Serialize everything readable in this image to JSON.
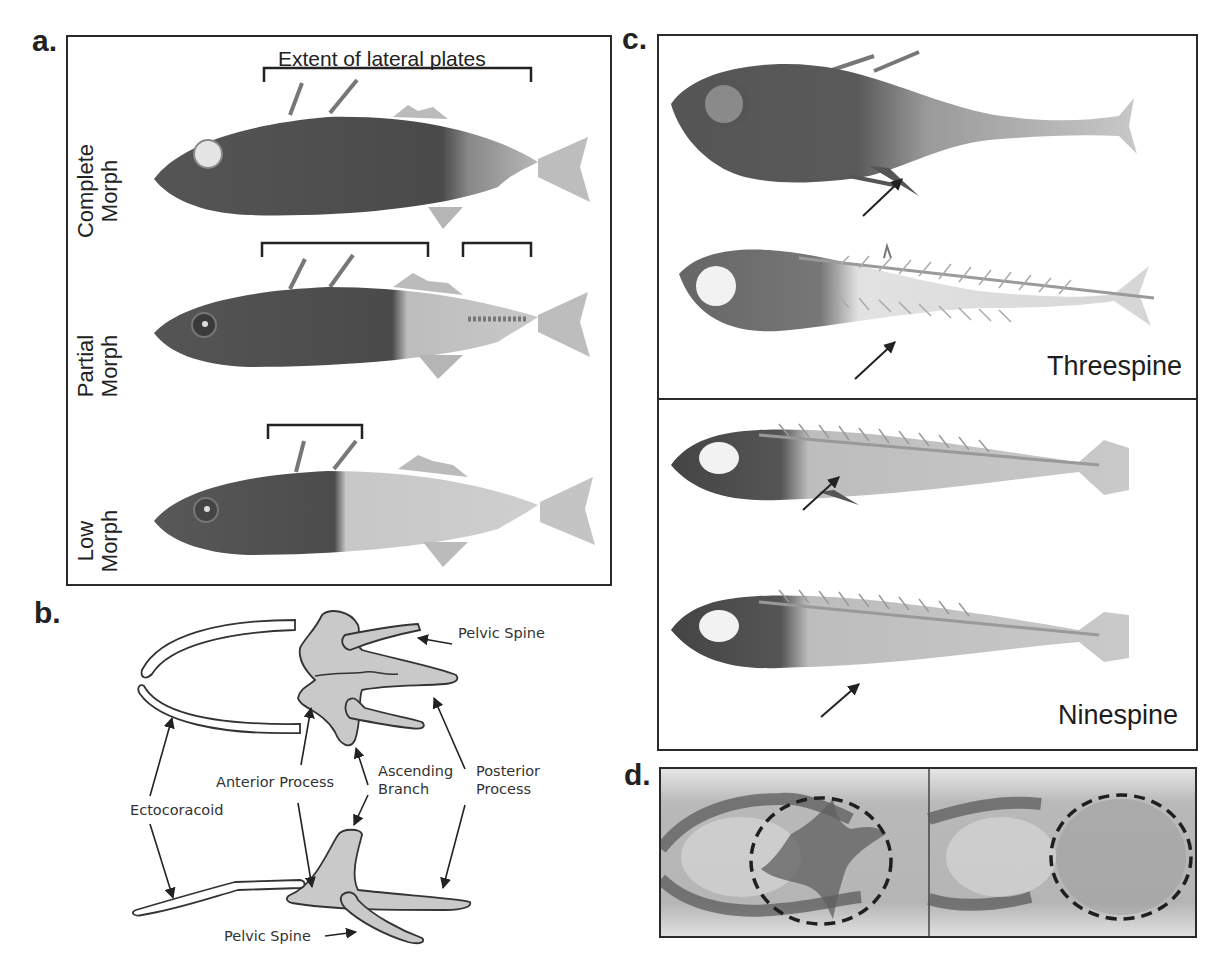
{
  "figure": {
    "panels": [
      {
        "id": "a",
        "letter": "a."
      },
      {
        "id": "b",
        "letter": "b."
      },
      {
        "id": "c",
        "letter": "c."
      },
      {
        "id": "d",
        "letter": "d."
      }
    ]
  },
  "panel_a": {
    "header": "Extent of lateral plates",
    "rows": [
      {
        "label_line1": "Complete",
        "label_line2": "Morph"
      },
      {
        "label_line1": "Partial",
        "label_line2": "Morph"
      },
      {
        "label_line1": "Low",
        "label_line2": "Morph"
      }
    ]
  },
  "panel_b": {
    "labels": {
      "pelvic_spine_top": "Pelvic Spine",
      "anterior_process": "Anterior Process",
      "ascending_branch_1": "Ascending",
      "ascending_branch_2": "Branch",
      "posterior_process_1": "Posterior",
      "posterior_process_2": "Process",
      "ectocoracoid": "Ectocoracoid",
      "pelvic_spine_bottom": "Pelvic Spine"
    }
  },
  "panel_c": {
    "species": [
      {
        "name": "Threespine"
      },
      {
        "name": "Ninespine"
      }
    ]
  },
  "colors": {
    "ink": "#222222",
    "bone_fill": "#c9c9c9",
    "fish_dark": "#4a4a4a",
    "fish_mid": "#8a8a8a",
    "fish_light": "#d4d4d4"
  }
}
